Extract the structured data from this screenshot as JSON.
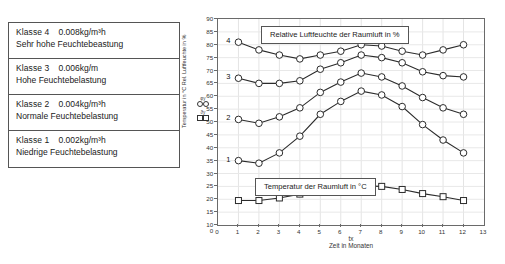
{
  "class_table": {
    "rows": [
      {
        "name": "Klasse 4",
        "value": "0.008kg/m³h",
        "description": "Sehr hohe Feuchtebeastung"
      },
      {
        "name": "Klasse 3",
        "value": "0.006kg/m",
        "description": "Hohe Feuchtebelastung"
      },
      {
        "name": "Klasse 2",
        "value": "0.004kg/m³h",
        "description": "Normale Feuchtebelastung"
      },
      {
        "name": "Klasse 1",
        "value": "0.002kg/m³h",
        "description": "Niedrige Feuchtebelastung"
      }
    ]
  },
  "legend": {
    "entries": [
      {
        "symbol": "φy",
        "marker": "circle-marker"
      },
      {
        "symbol": "ϑy",
        "marker": "square-marker"
      }
    ]
  },
  "chart_data": {
    "type": "line",
    "title": "",
    "xlabel": "Zeit in Monaten",
    "xsymbol": "tx",
    "ylabel": "Temperatur in °C  Rel. Luftfeuchte in %",
    "xlim": [
      0,
      13
    ],
    "ylim": [
      10,
      90
    ],
    "yticks": [
      10,
      15,
      20,
      25,
      30,
      35,
      40,
      45,
      50,
      55,
      60,
      65,
      70,
      75,
      80,
      85,
      90
    ],
    "xticks": [
      0,
      1,
      2,
      3,
      4,
      5,
      6,
      7,
      8,
      9,
      10,
      11,
      12,
      13
    ],
    "y_origin_label": "0",
    "grid": true,
    "legend_position": "left-outside",
    "annotations": [
      {
        "name": "humidity-box",
        "text": "Relative Luftfeuchte der Raumluft in %"
      },
      {
        "name": "temperature-box",
        "text": "Temperatur der Raumluft in °C"
      }
    ],
    "x": [
      1,
      2,
      3,
      4,
      5,
      6,
      7,
      8,
      9,
      10,
      11,
      12
    ],
    "series": [
      {
        "name": "Klasse 4",
        "tag": "4",
        "marker": "circle",
        "values": [
          81,
          78,
          76,
          74.5,
          76,
          77.5,
          80,
          79.5,
          77.5,
          76,
          78,
          80
        ]
      },
      {
        "name": "Klasse 3",
        "tag": "3",
        "marker": "circle",
        "values": [
          67,
          65,
          65,
          66,
          70.5,
          73,
          76,
          75,
          73,
          69.5,
          68,
          67.5
        ]
      },
      {
        "name": "Klasse 2",
        "tag": "2",
        "marker": "circle",
        "values": [
          51,
          49.5,
          52,
          55.5,
          61.5,
          65.5,
          69,
          67.5,
          64,
          59.5,
          55.5,
          53
        ]
      },
      {
        "name": "Klasse 1",
        "tag": "1",
        "marker": "circle",
        "values": [
          35,
          34,
          38,
          44.5,
          53,
          58,
          62,
          60.5,
          56,
          49,
          43,
          38
        ]
      },
      {
        "name": "Temperatur der Raumluft",
        "tag": "",
        "marker": "square",
        "values": [
          19.5,
          19.5,
          20.5,
          22,
          23.5,
          24.8,
          25.2,
          25,
          23.8,
          22.2,
          21,
          19.5
        ]
      }
    ]
  }
}
